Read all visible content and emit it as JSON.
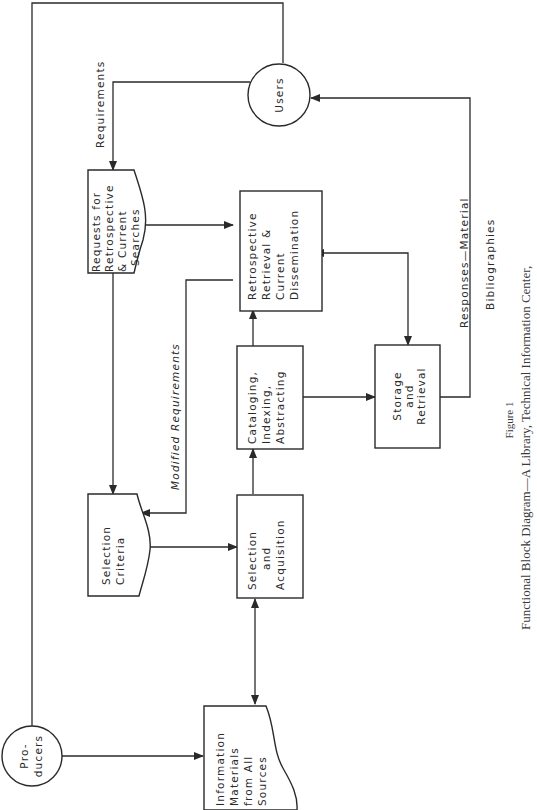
{
  "figure": {
    "number_label": "Figure 1",
    "caption": "Functional Block Diagram—A Library, Technical Information Center,"
  },
  "nodes": {
    "users": {
      "label": "Users"
    },
    "producers": {
      "line1": "Pro-",
      "line2": "ducers"
    },
    "requests": {
      "line1": "Requests for",
      "line2": "Retrospective",
      "line3": "& Current",
      "line4": "Searches"
    },
    "retrospective": {
      "line1": "Retrospective",
      "line2": "Retrieval &",
      "line3": "Current",
      "line4": "Dissemination"
    },
    "selection_criteria": {
      "line1": "Selection",
      "line2": "Criteria"
    },
    "selection_acquisition": {
      "line1": "Selection",
      "line2": "and",
      "line3": "Acquisition"
    },
    "cataloging": {
      "line1": "Cataloging,",
      "line2": "Indexing,",
      "line3": "Abstracting"
    },
    "storage": {
      "line1": "Storage",
      "line2": "and",
      "line3": "Retrieval"
    },
    "information_materials": {
      "line1": "Information",
      "line2": "Materials",
      "line3": "from All",
      "line4": "Sources"
    }
  },
  "edge_labels": {
    "requirements": "Requirements",
    "modified_requirements": "Modified Requirements",
    "responses_material": "Responses—Material",
    "bibliographies": "Bibliographies"
  },
  "colors": {
    "ink": "#2a2a2a",
    "paper": "#ffffff"
  }
}
